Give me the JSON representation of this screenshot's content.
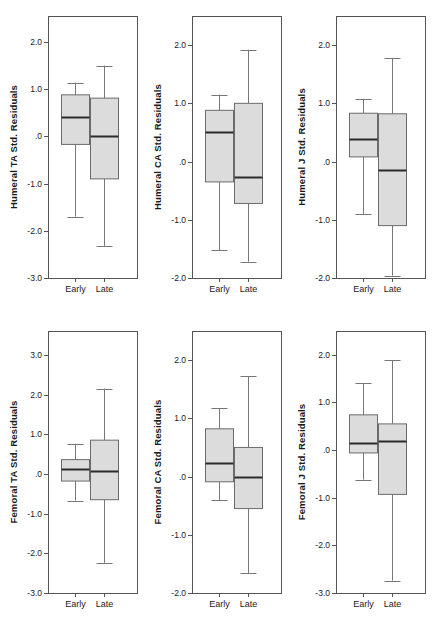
{
  "figure": {
    "width": 432,
    "height": 631,
    "background": "#ffffff",
    "box_fill": "#dcdcdc",
    "box_stroke": "#6b6b6b",
    "median_color": "#2b2b2b",
    "whisker_color": "#777777",
    "axis_color": "#555555",
    "rows": 2,
    "cols": 3
  },
  "chart_data": [
    {
      "type": "box",
      "panel_index": 0,
      "title": "",
      "ylabel": "Humeral TA Std. Residuals",
      "xlabel": "",
      "categories": [
        "Early",
        "Late"
      ],
      "ylim": [
        -3.0,
        2.55
      ],
      "yticks": [
        -3.0,
        -2.0,
        -1.0,
        0.0,
        1.0,
        2.0
      ],
      "ytick_labels": [
        "-3.0",
        "-2.0",
        "-1.0",
        ".0",
        "1.0",
        "2.0"
      ],
      "grid": false,
      "boxes": [
        {
          "category": "Early",
          "whisker_low": -1.7,
          "q1": -0.17,
          "median": 0.4,
          "q3": 0.88,
          "whisker_high": 1.14
        },
        {
          "category": "Late",
          "whisker_low": -2.32,
          "q1": -0.9,
          "median": 0.0,
          "q3": 0.81,
          "whisker_high": 1.5
        }
      ]
    },
    {
      "type": "box",
      "panel_index": 1,
      "title": "",
      "ylabel": "Humeral CA Std. Residuals",
      "xlabel": "",
      "categories": [
        "Early",
        "Late"
      ],
      "ylim": [
        -2.0,
        2.5
      ],
      "yticks": [
        -2.0,
        -1.0,
        0.0,
        1.0,
        2.0
      ],
      "ytick_labels": [
        "-2.0",
        "-1.0",
        ".0",
        "1.0",
        "2.0"
      ],
      "grid": false,
      "boxes": [
        {
          "category": "Early",
          "whisker_low": -1.52,
          "q1": -0.35,
          "median": 0.5,
          "q3": 0.88,
          "whisker_high": 1.15
        },
        {
          "category": "Late",
          "whisker_low": -1.72,
          "q1": -0.72,
          "median": -0.27,
          "q3": 1.0,
          "whisker_high": 1.92
        }
      ]
    },
    {
      "type": "box",
      "panel_index": 2,
      "title": "",
      "ylabel": "Humeral J Std. Residuals",
      "xlabel": "",
      "categories": [
        "Early",
        "Late"
      ],
      "ylim": [
        -2.0,
        2.5
      ],
      "yticks": [
        -2.0,
        -1.0,
        0.0,
        1.0,
        2.0
      ],
      "ytick_labels": [
        "-2.0",
        "-1.0",
        ".0",
        "1.0",
        "2.0"
      ],
      "grid": false,
      "boxes": [
        {
          "category": "Early",
          "whisker_low": -0.9,
          "q1": 0.08,
          "median": 0.39,
          "q3": 0.83,
          "whisker_high": 1.08
        },
        {
          "category": "Late",
          "whisker_low": -1.96,
          "q1": -1.1,
          "median": -0.15,
          "q3": 0.82,
          "whisker_high": 1.78
        }
      ]
    },
    {
      "type": "box",
      "panel_index": 3,
      "title": "",
      "ylabel": "Femoral TA Std. Residuals",
      "xlabel": "",
      "categories": [
        "Early",
        "Late"
      ],
      "ylim": [
        -3.0,
        3.6
      ],
      "yticks": [
        -3.0,
        -2.0,
        -1.0,
        0.0,
        1.0,
        2.0,
        3.0
      ],
      "ytick_labels": [
        "-3.0",
        "-2.0",
        "-1.0",
        ".0",
        "1.0",
        "2.0",
        "3.0"
      ],
      "grid": false,
      "boxes": [
        {
          "category": "Early",
          "whisker_low": -0.67,
          "q1": -0.18,
          "median": 0.12,
          "q3": 0.36,
          "whisker_high": 0.76
        },
        {
          "category": "Late",
          "whisker_low": -2.24,
          "q1": -0.65,
          "median": 0.08,
          "q3": 0.85,
          "whisker_high": 2.15
        }
      ]
    },
    {
      "type": "box",
      "panel_index": 4,
      "title": "",
      "ylabel": "Femoral CA Std. Residuals",
      "xlabel": "",
      "categories": [
        "Early",
        "Late"
      ],
      "ylim": [
        -2.0,
        2.5
      ],
      "yticks": [
        -2.0,
        -1.0,
        0.0,
        1.0,
        2.0
      ],
      "ytick_labels": [
        "-2.0",
        "-1.0",
        ".0",
        "1.0",
        "2.0"
      ],
      "grid": false,
      "boxes": [
        {
          "category": "Early",
          "whisker_low": -0.4,
          "q1": -0.09,
          "median": 0.24,
          "q3": 0.82,
          "whisker_high": 1.17
        },
        {
          "category": "Late",
          "whisker_low": -1.66,
          "q1": -0.55,
          "median": 0.0,
          "q3": 0.5,
          "whisker_high": 1.72
        }
      ]
    },
    {
      "type": "box",
      "panel_index": 5,
      "title": "",
      "ylabel": "Femoral J Std. Residuals",
      "xlabel": "",
      "categories": [
        "Early",
        "Late"
      ],
      "ylim": [
        -3.0,
        2.5
      ],
      "yticks": [
        -3.0,
        -2.0,
        -1.0,
        0.0,
        1.0,
        2.0
      ],
      "ytick_labels": [
        "-3.0",
        "-2.0",
        "-1.0",
        ".0",
        "1.0",
        "2.0"
      ],
      "grid": false,
      "boxes": [
        {
          "category": "Early",
          "whisker_low": -0.62,
          "q1": -0.06,
          "median": 0.14,
          "q3": 0.74,
          "whisker_high": 1.4
        },
        {
          "category": "Late",
          "whisker_low": -2.74,
          "q1": -0.93,
          "median": 0.2,
          "q3": 0.55,
          "whisker_high": 1.89
        }
      ]
    }
  ]
}
